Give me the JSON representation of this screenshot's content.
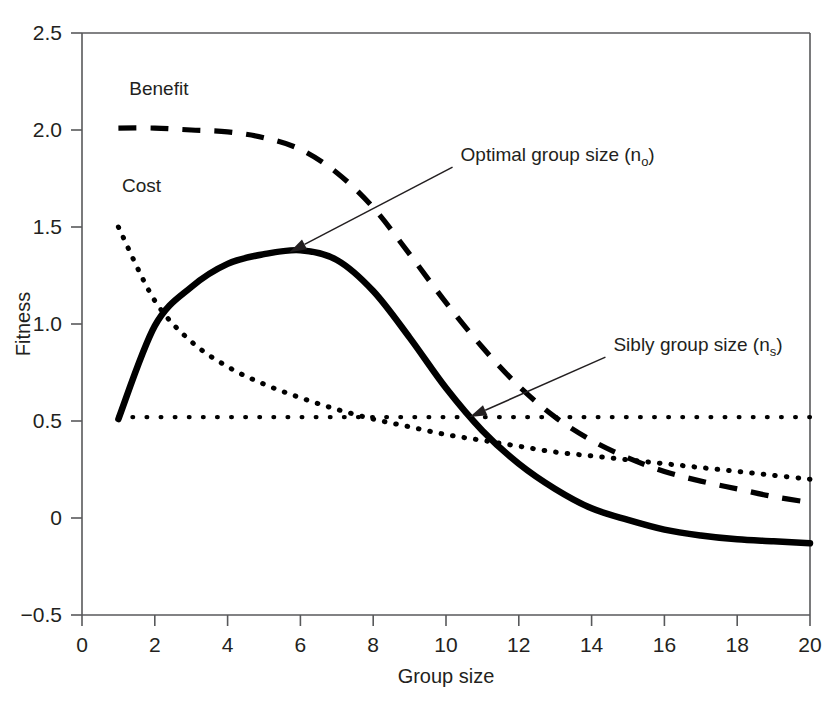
{
  "chart_data": {
    "type": "line",
    "title": "",
    "xlabel": "Group size",
    "ylabel": "Fitness",
    "xlim": [
      0,
      20
    ],
    "ylim": [
      -0.5,
      2.5
    ],
    "xticks": [
      "0",
      "2",
      "4",
      "6",
      "8",
      "10",
      "12",
      "14",
      "16",
      "18",
      "20"
    ],
    "yticks": [
      "2.5",
      "2.0",
      "1.5",
      "1.0",
      "0.5",
      "0",
      "-0.5"
    ],
    "grid": false,
    "legend_position": "inline-labels",
    "x": [
      1,
      2,
      3,
      4,
      5,
      6,
      7,
      8,
      9,
      10,
      11,
      12,
      13,
      14,
      15,
      16,
      17,
      18,
      19,
      20
    ],
    "series": [
      {
        "name": "Benefit",
        "style": "dashed",
        "values": [
          2.01,
          2.01,
          2.0,
          1.99,
          1.96,
          1.9,
          1.78,
          1.6,
          1.36,
          1.11,
          0.88,
          0.68,
          0.52,
          0.4,
          0.31,
          0.24,
          0.19,
          0.15,
          0.11,
          0.08
        ]
      },
      {
        "name": "Cost",
        "style": "dotted",
        "values": [
          1.5,
          1.12,
          0.91,
          0.78,
          0.69,
          0.62,
          0.56,
          0.51,
          0.47,
          0.43,
          0.4,
          0.37,
          0.34,
          0.32,
          0.3,
          0.28,
          0.26,
          0.24,
          0.22,
          0.2
        ]
      },
      {
        "name": "Net benefit",
        "style": "solid",
        "values": [
          0.51,
          0.99,
          1.19,
          1.31,
          1.36,
          1.38,
          1.33,
          1.17,
          0.93,
          0.67,
          0.45,
          0.28,
          0.15,
          0.05,
          -0.01,
          -0.06,
          -0.09,
          -0.11,
          -0.12,
          -0.13
        ]
      }
    ],
    "reference_line": {
      "name": "Sibly fitness threshold",
      "style": "dotted",
      "y": 0.52,
      "x_start": 1,
      "x_end": 20
    },
    "series_labels": [
      {
        "text": "Benefit",
        "x": 1.3,
        "y": 2.18
      },
      {
        "text": "Cost",
        "x": 1.1,
        "y": 1.68
      }
    ],
    "annotations": [
      {
        "text": "Optimal group size (n",
        "sub": "o",
        "tail": ")",
        "label_x": 10.4,
        "label_y": 1.84,
        "point_x": 5.7,
        "point_y": 1.37
      },
      {
        "text": "Sibly group size (n",
        "sub": "s",
        "tail": ")",
        "label_x": 14.6,
        "label_y": 0.86,
        "point_x": 10.65,
        "point_y": 0.52
      }
    ]
  },
  "colors": {
    "ink": "#231f20",
    "axis": "#58595b",
    "curve": "#000000",
    "background": "#ffffff"
  }
}
